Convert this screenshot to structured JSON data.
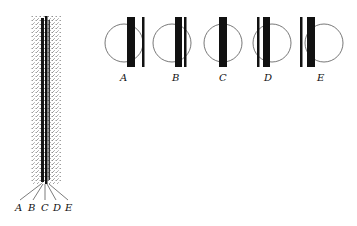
{
  "figure": {
    "column": {
      "x_center": 45,
      "top": 16,
      "bottom": 184,
      "band_labels": [
        "A",
        "B",
        "C",
        "D",
        "E"
      ]
    },
    "panels": [
      {
        "label": "A",
        "cx": 124,
        "thick_x": 127,
        "thin_x": 143,
        "thin_side": "right"
      },
      {
        "label": "B",
        "cx": 172,
        "thick_x": 174,
        "thin_x": 184,
        "thin_side": "right"
      },
      {
        "label": "C",
        "cx": 222,
        "thick_x": 219,
        "thin_x": null,
        "thin_side": "none"
      },
      {
        "label": "D",
        "cx": 271,
        "thick_x": 263,
        "thin_x": 257,
        "thin_side": "left"
      },
      {
        "label": "E",
        "cx": 324,
        "thick_x": 307,
        "thin_x": 299,
        "thin_side": "left"
      }
    ],
    "colors": {
      "ink": "#111111",
      "stipple": "#9a9a9a",
      "circle": "#555555"
    }
  }
}
